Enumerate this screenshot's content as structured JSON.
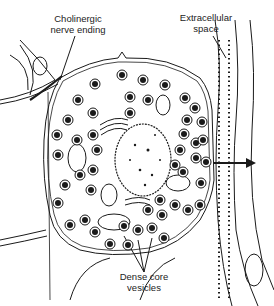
{
  "diagram": {
    "type": "cell-illustration",
    "labels": {
      "cholinergic": {
        "line1": "Cholinergic",
        "line2": "nerve ending"
      },
      "extracellular": {
        "line1": "Extracellular",
        "line2": "space"
      },
      "dense_core": {
        "line1": "Dense core",
        "line2": "vesicles"
      }
    },
    "structures": [
      "cell membrane",
      "nucleus",
      "mitochondria",
      "golgi apparatus",
      "dense core vesicles",
      "nerve ending",
      "extracellular space",
      "exocytosis arrow"
    ],
    "colors": {
      "ink": "#1a1a1a",
      "background": "#ffffff"
    }
  }
}
